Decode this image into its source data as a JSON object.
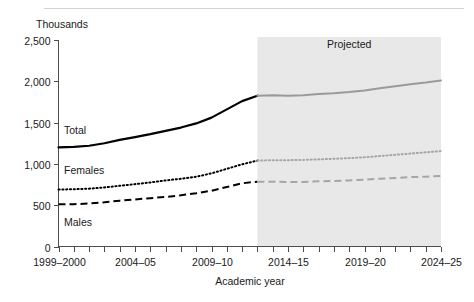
{
  "chart_data": {
    "type": "line",
    "title": "",
    "unit_label": "Thousands",
    "xlabel": "Academic year",
    "ylabel": "",
    "ylim": [
      0,
      2500
    ],
    "yticks": [
      0,
      500,
      1000,
      1500,
      2000,
      2500
    ],
    "ytick_labels": [
      "0",
      "500",
      "1,000",
      "1,500",
      "2,000",
      "2,500"
    ],
    "grid": false,
    "legend_position": "inline-labels",
    "annotations": [
      {
        "text": "Projected",
        "x": "2018-19",
        "y": 2380
      }
    ],
    "projection_start": "2012-13",
    "x": [
      "1999-2000",
      "2000-01",
      "2001-02",
      "2002-03",
      "2003-04",
      "2004-05",
      "2005-06",
      "2006-07",
      "2007-08",
      "2008-09",
      "2009-10",
      "2010-11",
      "2011-12",
      "2012-13",
      "2013-14",
      "2014-15",
      "2015-16",
      "2016-17",
      "2017-18",
      "2018-19",
      "2019-20",
      "2020-21",
      "2021-22",
      "2022-23",
      "2023-24",
      "2024-25"
    ],
    "xtick_labels": [
      "1999–2000",
      "2004–05",
      "2009–10",
      "2014–15",
      "2019–20",
      "2024–25"
    ],
    "series": [
      {
        "name": "Total",
        "style": "solid",
        "values": [
          1200,
          1205,
          1220,
          1250,
          1290,
          1325,
          1360,
          1400,
          1440,
          1490,
          1560,
          1660,
          1760,
          1825,
          1830,
          1825,
          1830,
          1845,
          1855,
          1870,
          1890,
          1915,
          1940,
          1965,
          1985,
          2010
        ]
      },
      {
        "name": "Females",
        "style": "dotted",
        "values": [
          690,
          693,
          700,
          715,
          735,
          755,
          775,
          800,
          820,
          845,
          885,
          940,
          995,
          1040,
          1045,
          1045,
          1048,
          1055,
          1062,
          1070,
          1080,
          1095,
          1110,
          1125,
          1140,
          1155
        ]
      },
      {
        "name": "Males",
        "style": "dashed",
        "values": [
          510,
          512,
          520,
          535,
          555,
          570,
          585,
          600,
          620,
          645,
          675,
          720,
          765,
          785,
          785,
          780,
          782,
          790,
          793,
          800,
          810,
          820,
          830,
          840,
          845,
          855
        ]
      }
    ]
  },
  "labels": {
    "total": "Total",
    "females": "Females",
    "males": "Males",
    "projected": "Projected",
    "unit": "Thousands",
    "x_axis_title": "Academic year"
  },
  "colors": {
    "actual_line": "#000000",
    "projected_line": "#9a9a9a",
    "projected_band": "#e8e8e8",
    "axis": "#4d4d4d",
    "text": "#1a1a1a"
  }
}
